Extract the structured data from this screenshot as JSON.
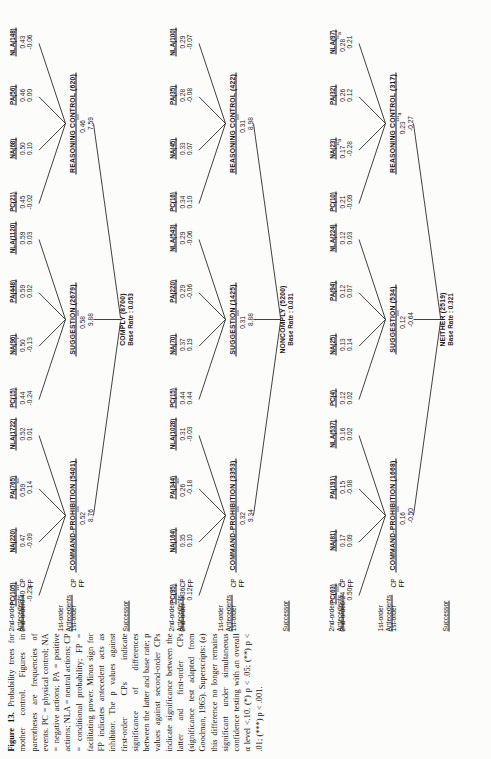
{
  "figure": {
    "label": "Figure 13.",
    "caption": "Probability trees for mother control. Figures in parentheses are frequencies of events. PC = physical control; NA = negative actions; PA = positive actions; NLA = neutral actions; CP = conditional probability; FP = facilitating power. Minus sign for FP indicates antecedent acts as inhibitor. The p values against first-order CPs indicate significance of differences between the latter and base rate; p values against second-order CPs indicate significance between the latter and first-order CPs (significance test adapted from Goodman, 1965). Superscripts: (a) this difference no longer remains significant under simultaneous confidence testing with an overall α level <.10. (*) p < .05; (**) p < .01; (***) p < .001."
  },
  "row_labels": {
    "second_order_antecedents": "2nd-order\nAntecedents",
    "second_order": "2nd-order",
    "first_order_antecedents": "1st-order\nAntecedents",
    "first_order": "1st-order",
    "successor": "Successor",
    "cp": "CP",
    "fp": "FP"
  },
  "trees": [
    {
      "successor": {
        "name": "COMPLY",
        "n": "(8700)",
        "base_rate_label": "Base Rate : 0.053"
      },
      "first_order": [
        {
          "name": "COMMAND-PROHIBITION",
          "n": "(5401)",
          "cp": "0.52",
          "cp_sup": "***",
          "fp": "8.76",
          "second_order": [
            {
              "name": "PC",
              "n": "(105)",
              "cp": "0.40",
              "cp_sup": "***",
              "fp": "-0.23"
            },
            {
              "name": "NA",
              "n": "(220)",
              "cp": "0.47",
              "cp_sup": "",
              "fp": "-0.09"
            },
            {
              "name": "PA",
              "n": "(765)",
              "cp": "0.59",
              "cp_sup": "***",
              "fp": "0.14"
            },
            {
              "name": "NLA",
              "n": "(1722)",
              "cp": "0.52",
              "cp_sup": "",
              "fp": "0.01"
            }
          ]
        },
        {
          "name": "SUGGESTION",
          "n": "(2679)",
          "cp": "0.58",
          "cp_sup": "***",
          "fp": "9.88",
          "second_order": [
            {
              "name": "PC",
              "n": "(15)",
              "cp": "0.44",
              "cp_sup": "",
              "fp": "-0.24"
            },
            {
              "name": "NA",
              "n": "(96)",
              "cp": "0.50",
              "cp_sup": "*",
              "fp": "-0.13"
            },
            {
              "name": "PA",
              "n": "(448)",
              "cp": "0.59",
              "cp_sup": "",
              "fp": "0.02"
            },
            {
              "name": "NLA",
              "n": "(1120)",
              "cp": "0.59",
              "cp_sup": "",
              "fp": "0.03"
            }
          ]
        },
        {
          "name": "REASONING CONTROL",
          "n": "(620)",
          "cp": "0.46",
          "cp_sup": "***",
          "fp": "7.59",
          "second_order": [
            {
              "name": "PC",
              "n": "(21)",
              "cp": "0.45",
              "cp_sup": "",
              "fp": "-0.02"
            },
            {
              "name": "NA",
              "n": "(68)",
              "cp": "0.50",
              "cp_sup": "",
              "fp": "0.10"
            },
            {
              "name": "PA",
              "n": "(56)",
              "cp": "0.46",
              "cp_sup": "",
              "fp": "0.00"
            },
            {
              "name": "NLA",
              "n": "(148)",
              "cp": "0.43",
              "cp_sup": "",
              "fp": "-0.06"
            }
          ]
        }
      ]
    },
    {
      "successor": {
        "name": "NONCOMPLY",
        "n": "(5200)",
        "base_rate_label": "Base Rate : 0.031"
      },
      "first_order": [
        {
          "name": "COMMAND-PROHIBITION",
          "n": "(3353)",
          "cp": "0.32",
          "cp_sup": "***",
          "fp": "9.34",
          "second_order": [
            {
              "name": "PC",
              "n": "(95)",
              "cp": "0.36",
              "cp_sup": "",
              "fp": "0.12"
            },
            {
              "name": "NA",
              "n": "(164)",
              "cp": "0.35",
              "cp_sup": "",
              "fp": "0.10"
            },
            {
              "name": "PA",
              "n": "(344)",
              "cp": "0.26",
              "cp_sup": "***",
              "fp": "-0.18"
            },
            {
              "name": "NLA",
              "n": "(1028)",
              "cp": "0.31",
              "cp_sup": "",
              "fp": "-0.03"
            }
          ]
        },
        {
          "name": "SUGGESTION",
          "n": "(1425)",
          "cp": "0.31",
          "cp_sup": "***",
          "fp": "8.88",
          "second_order": [
            {
              "name": "PC",
              "n": "(15)",
              "cp": "0.44",
              "cp_sup": "",
              "fp": "0.44"
            },
            {
              "name": "NA",
              "n": "(70)",
              "cp": "0.37",
              "cp_sup": "",
              "fp": "0.19"
            },
            {
              "name": "PA",
              "n": "(220)",
              "cp": "0.29",
              "cp_sup": "",
              "fp": "-0.06"
            },
            {
              "name": "NLA",
              "n": "(543)",
              "cp": "0.29",
              "cp_sup": "",
              "fp": "-0.06"
            }
          ]
        },
        {
          "name": "REASONING CONTROL",
          "n": "(422)",
          "cp": "0.31",
          "cp_sup": "***",
          "fp": "8.98",
          "second_order": [
            {
              "name": "PC",
              "n": "(16)",
              "cp": "0.34",
              "cp_sup": "",
              "fp": "0.10"
            },
            {
              "name": "NA",
              "n": "(45)",
              "cp": "0.33",
              "cp_sup": "",
              "fp": "0.07"
            },
            {
              "name": "PA",
              "n": "(35)",
              "cp": "0.28",
              "cp_sup": "",
              "fp": "-0.08"
            },
            {
              "name": "NLA",
              "n": "(100)",
              "cp": "0.29",
              "cp_sup": "",
              "fp": "-0.07"
            }
          ]
        }
      ]
    },
    {
      "successor": {
        "name": "NEITHER",
        "n": "(2519)",
        "base_rate_label": "Base Rate : 0.321"
      },
      "first_order": [
        {
          "name": "COMMAND-PROHIBITION",
          "n": "(1668)",
          "cp": "0.16",
          "cp_sup": "***",
          "fp": "-0.50",
          "second_order": [
            {
              "name": "PC",
              "n": "(63)",
              "cp": "0.24",
              "cp_sup": "***a",
              "fp": "0.50"
            },
            {
              "name": "NA",
              "n": "(81)",
              "cp": "0.17",
              "cp_sup": "",
              "fp": "0.09"
            },
            {
              "name": "PA",
              "n": "(191)",
              "cp": "0.15",
              "cp_sup": "",
              "fp": "-0.08"
            },
            {
              "name": "NLA",
              "n": "(537)",
              "cp": "0.16",
              "cp_sup": "",
              "fp": "0.02"
            }
          ]
        },
        {
          "name": "SUGGESTION",
          "n": "(534)",
          "cp": "0.12",
          "cp_sup": "***",
          "fp": "-0.64",
          "second_order": [
            {
              "name": "PC",
              "n": "(4)",
              "cp": "0.12",
              "cp_sup": "",
              "fp": "0.02"
            },
            {
              "name": "NA",
              "n": "(25)",
              "cp": "0.13",
              "cp_sup": "",
              "fp": "0.14"
            },
            {
              "name": "PA",
              "n": "(94)",
              "cp": "0.12",
              "cp_sup": "",
              "fp": "0.07"
            },
            {
              "name": "NLA",
              "n": "(224)",
              "cp": "0.12",
              "cp_sup": "",
              "fp": "0.03"
            }
          ]
        },
        {
          "name": "REASONING CONTROL",
          "n": "(317)",
          "cp": "0.23",
          "cp_sup": "***a",
          "fp": "-0.27",
          "second_order": [
            {
              "name": "PC",
              "n": "(10)",
              "cp": "0.21",
              "cp_sup": "",
              "fp": "-0.09"
            },
            {
              "name": "NA",
              "n": "(23)",
              "cp": "0.17",
              "cp_sup": "**a",
              "fp": "-0.28"
            },
            {
              "name": "PA",
              "n": "(32)",
              "cp": "0.26",
              "cp_sup": "",
              "fp": "0.12"
            },
            {
              "name": "NLA",
              "n": "(97)",
              "cp": "0.28",
              "cp_sup": "**a",
              "fp": "0.21"
            }
          ]
        }
      ]
    }
  ]
}
